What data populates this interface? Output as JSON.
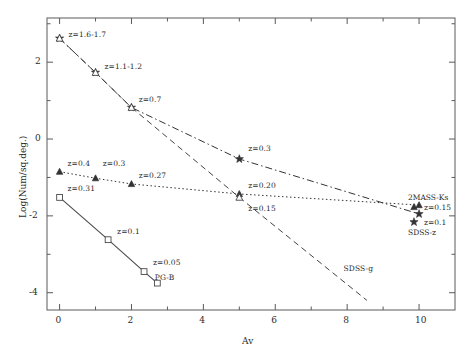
{
  "chart_data": {
    "type": "line",
    "title": "",
    "xlabel": "Av",
    "ylabel": "Log(Num/sq.deg.)",
    "xlim": [
      -0.35,
      11.0
    ],
    "ylim": [
      -4.45,
      3.15
    ],
    "grid": false,
    "legend_position": "inline-annotations",
    "xticks": [
      0,
      2,
      4,
      6,
      8,
      10
    ],
    "xticklabels": [
      "0",
      "2",
      "4",
      "6",
      "8",
      "10"
    ],
    "yticks": [
      2,
      0,
      -2,
      -4
    ],
    "yticklabels": [
      "2",
      "0",
      "-2",
      "-4"
    ],
    "xminorticks": [
      1,
      3,
      5,
      7,
      9
    ],
    "yminorticks": [
      3,
      1,
      -1,
      -3
    ],
    "series": [
      {
        "name": "2MASS-Ks",
        "marker": "triangle-filled",
        "linestyle": "dotted",
        "color": "#333333",
        "x": [
          0,
          1,
          2,
          5,
          10
        ],
        "y": [
          -0.85,
          -1.02,
          -1.17,
          -1.43,
          -1.72
        ],
        "point_labels": [
          "z=0.4",
          "z=0.3",
          "z=0.27",
          "z=0.20",
          "z=0.15"
        ]
      },
      {
        "name": "SDSS-z",
        "marker": "star",
        "linestyle": "dashdot",
        "color": "#333333",
        "x": [
          0,
          1,
          2,
          5,
          10
        ],
        "y": [
          2.62,
          1.73,
          0.82,
          -0.52,
          -1.95
        ],
        "point_labels": [
          "z=1.6-1.7",
          "z=1.1-1.2",
          "z=0.7",
          "z=0.3",
          "z=0.1"
        ]
      },
      {
        "name": "SDSS-g",
        "marker": "triangle-open",
        "linestyle": "dashed",
        "color": "#444444",
        "x": [
          0,
          1,
          2,
          5,
          8.55
        ],
        "y": [
          2.62,
          1.73,
          0.82,
          -1.52,
          -4.2
        ],
        "point_labels": [
          "",
          "",
          "",
          "z=0.15",
          ""
        ]
      },
      {
        "name": "PG-B",
        "marker": "square-open",
        "linestyle": "solid",
        "color": "#4a4a4a",
        "x": [
          0,
          1.35,
          2.35,
          2.72
        ],
        "y": [
          -1.52,
          -2.62,
          -3.45,
          -3.75
        ],
        "point_labels": [
          "z=0.31",
          "z=0.1",
          "z=0.05",
          ""
        ]
      }
    ],
    "annotations": [
      {
        "text": "z=1.6-1.7",
        "x": 0.25,
        "y": 2.72
      },
      {
        "text": "z=1.1-1.2",
        "x": 1.25,
        "y": 1.88
      },
      {
        "text": "z=0.7",
        "x": 2.2,
        "y": 1.02
      },
      {
        "text": "z=0.3",
        "x": 5.25,
        "y": -0.26
      },
      {
        "text": "z=0.4",
        "x": 0.22,
        "y": -0.66
      },
      {
        "text": "z=0.3",
        "x": 1.2,
        "y": -0.66
      },
      {
        "text": "z=0.27",
        "x": 2.2,
        "y": -0.95
      },
      {
        "text": "z=0.20",
        "x": 5.25,
        "y": -1.22
      },
      {
        "text": "z=0.15",
        "x": 5.25,
        "y": -1.82
      },
      {
        "text": "z=0.31",
        "x": 0.22,
        "y": -1.3
      },
      {
        "text": "z=0.1",
        "x": 1.6,
        "y": -2.42
      },
      {
        "text": "z=0.05",
        "x": 2.6,
        "y": -3.22
      },
      {
        "text": "PG-B",
        "x": 2.65,
        "y": -3.62
      },
      {
        "text": "SDSS-g",
        "x": 7.9,
        "y": -3.38
      }
    ],
    "legend_entries": [
      {
        "label": "2MASS-Ks",
        "sublabel": "z=0.15",
        "marker": "triangle-filled"
      },
      {
        "label": "SDSS-z",
        "sublabel": "z=0.1",
        "marker": "star"
      }
    ]
  }
}
